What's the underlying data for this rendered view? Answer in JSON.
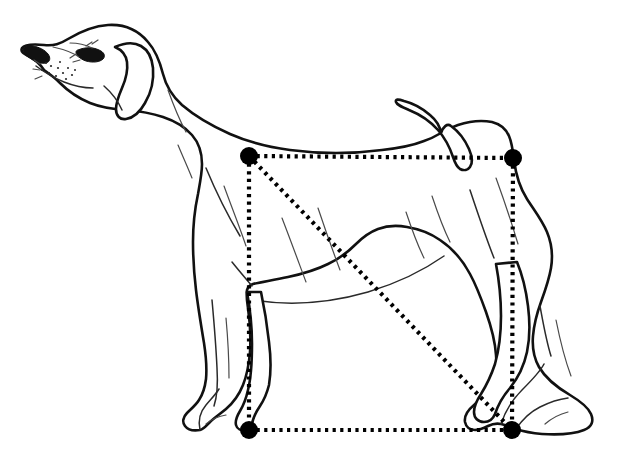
{
  "figure": {
    "background_color": "#ffffff",
    "outline_color": "#111111",
    "measurement_color": "#000000",
    "canvas": {
      "width": 617,
      "height": 453
    }
  },
  "measurement_overlay": {
    "shape": "rectangle-with-diagonal",
    "description": "Dotted square overlaid on the dog marking height at withers versus body length, with a dotted diagonal from the withers to the rear foot.",
    "stroke_style": "dotted",
    "corner_marker_style": "filled-circle",
    "corner_marker_radius": 9,
    "corners": [
      {
        "id": "top-left",
        "label": "withers",
        "x": 249,
        "y": 156
      },
      {
        "id": "top-right",
        "label": "tail-set",
        "x": 513,
        "y": 158
      },
      {
        "id": "bottom-right",
        "label": "rear-foot",
        "x": 512,
        "y": 430
      },
      {
        "id": "bottom-left",
        "label": "front-foot",
        "x": 249,
        "y": 430
      }
    ],
    "edges": [
      {
        "id": "top-edge",
        "from": "top-left",
        "to": "top-right"
      },
      {
        "id": "right-edge",
        "from": "top-right",
        "to": "bottom-right"
      },
      {
        "id": "bottom-edge",
        "from": "bottom-left",
        "to": "bottom-right"
      },
      {
        "id": "left-edge",
        "from": "top-left",
        "to": "bottom-left"
      },
      {
        "id": "diagonal",
        "from": "top-left",
        "to": "bottom-right"
      }
    ],
    "rectangle_width_px": 264,
    "rectangle_height_px": 274
  },
  "dog_parts": [
    {
      "id": "head",
      "label": "Head"
    },
    {
      "id": "muzzle",
      "label": "Muzzle"
    },
    {
      "id": "nose",
      "label": "Nose"
    },
    {
      "id": "eye",
      "label": "Eye"
    },
    {
      "id": "ear",
      "label": "Drop ear"
    },
    {
      "id": "neck",
      "label": "Neck"
    },
    {
      "id": "withers",
      "label": "Withers"
    },
    {
      "id": "topline",
      "label": "Topline / back"
    },
    {
      "id": "tail",
      "label": "Tail"
    },
    {
      "id": "chest",
      "label": "Chest"
    },
    {
      "id": "underline",
      "label": "Underline / tuck-up"
    },
    {
      "id": "foreleg",
      "label": "Foreleg"
    },
    {
      "id": "hindleg",
      "label": "Hind leg"
    },
    {
      "id": "hock",
      "label": "Hock"
    },
    {
      "id": "front-paw",
      "label": "Front paw"
    },
    {
      "id": "rear-paw",
      "label": "Rear paw"
    }
  ]
}
